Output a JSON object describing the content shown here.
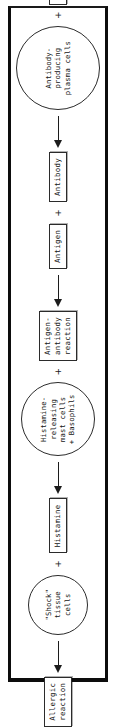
{
  "diagram": {
    "orientation": "rotated-90-ccw",
    "frame_color": "#0d0d0d",
    "line_color": "#1c1c1c",
    "plus_symbol": "+",
    "stages": [
      {
        "id": "stage-1",
        "operands": [
          {
            "id": "antigen-1",
            "shape": "box",
            "label": "Antigen"
          },
          {
            "id": "plasma-cells",
            "shape": "circle",
            "size": "large",
            "label": "Antibody-\nproducing\nplasma cells"
          }
        ]
      },
      {
        "id": "stage-2",
        "operands": [
          {
            "id": "antibody",
            "shape": "box",
            "label": "Antibody"
          },
          {
            "id": "antigen-2",
            "shape": "box",
            "label": "Antigen"
          }
        ]
      },
      {
        "id": "stage-3",
        "operands": [
          {
            "id": "antigen-antibody-reaction",
            "shape": "box",
            "label": "Antigen-\nantibody\nreaction"
          },
          {
            "id": "mast-cells-basophils",
            "shape": "circle",
            "size": "med",
            "label": "Histamine-\nreleasing\nmast cells\n+ Basophils"
          }
        ]
      },
      {
        "id": "stage-4",
        "operands": [
          {
            "id": "histamine",
            "shape": "box",
            "label": "Histamine"
          },
          {
            "id": "shock-tissue-cells",
            "shape": "circle",
            "size": "small",
            "label": "\"Shock\"\ntissue\ncells"
          }
        ]
      },
      {
        "id": "stage-5",
        "operands": [
          {
            "id": "allergic-reaction",
            "shape": "box",
            "label": "Allergic\nreaction"
          }
        ]
      }
    ]
  }
}
